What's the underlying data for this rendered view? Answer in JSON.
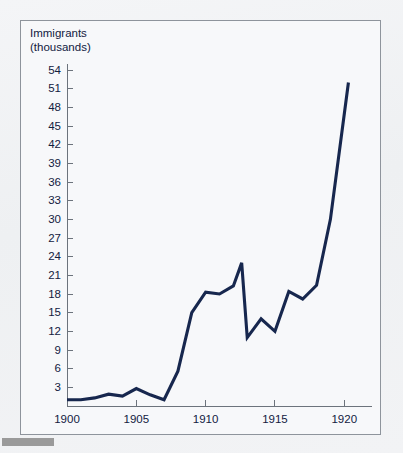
{
  "figure": {
    "title_line1": "Immigrants",
    "title_line2": "(thousands)",
    "background_color": "#f7f8fa",
    "frame_color": "#8e949c",
    "line_color": "#17274e",
    "axis_color": "#6c737c",
    "gray_bar_color": "#9a9a9a"
  },
  "chart_data": {
    "type": "line",
    "title": "Immigrants (thousands)",
    "xlabel": "",
    "ylabel": "Immigrants (thousands)",
    "xlim": [
      1900,
      1922
    ],
    "ylim": [
      0,
      54
    ],
    "grid": false,
    "legend": "none",
    "ytick_labels": [
      "54",
      "51",
      "48",
      "45",
      "42",
      "39",
      "36",
      "33",
      "30",
      "27",
      "24",
      "21",
      "18",
      "15",
      "12",
      "9",
      "6",
      "3"
    ],
    "ytick_values": [
      54,
      51,
      48,
      45,
      42,
      39,
      36,
      33,
      30,
      27,
      24,
      21,
      18,
      15,
      12,
      9,
      6,
      3
    ],
    "xtick_labels": [
      "1900",
      "1905",
      "1910",
      "1915",
      "1920"
    ],
    "xtick_values": [
      1900,
      1905,
      1910,
      1915,
      1920
    ],
    "x": [
      1900,
      1901,
      1902,
      1903,
      1904,
      1905,
      1906,
      1907,
      1908,
      1909,
      1910,
      1911,
      1912,
      1913,
      1914,
      1915,
      1916,
      1917,
      1918,
      1919,
      1920,
      1921
    ],
    "values": [
      1.0,
      1.0,
      1.2,
      1.8,
      1.6,
      1.5,
      2.8,
      1.0,
      1.0,
      5.6,
      15.0,
      18.3,
      18.0,
      19.2,
      23.0,
      11.0,
      14.0,
      13.1,
      12.0,
      18.4,
      17.2,
      19.4
    ],
    "series": [
      {
        "name": "Immigrants",
        "points": [
          {
            "x": 1900,
            "y": 1.0
          },
          {
            "x": 1901,
            "y": 1.0
          },
          {
            "x": 1902,
            "y": 1.3
          },
          {
            "x": 1903,
            "y": 1.9
          },
          {
            "x": 1904,
            "y": 1.6
          },
          {
            "x": 1905,
            "y": 2.8
          },
          {
            "x": 1906,
            "y": 1.8
          },
          {
            "x": 1907,
            "y": 1.0
          },
          {
            "x": 1908,
            "y": 5.6
          },
          {
            "x": 1909,
            "y": 15.0
          },
          {
            "x": 1910,
            "y": 18.3
          },
          {
            "x": 1911,
            "y": 18.0
          },
          {
            "x": 1912,
            "y": 19.3
          },
          {
            "x": 1912.6,
            "y": 23.0
          },
          {
            "x": 1913,
            "y": 11.0
          },
          {
            "x": 1914,
            "y": 14.0
          },
          {
            "x": 1915,
            "y": 12.0
          },
          {
            "x": 1916,
            "y": 18.4
          },
          {
            "x": 1917,
            "y": 17.2
          },
          {
            "x": 1918,
            "y": 19.4
          },
          {
            "x": 1919,
            "y": 30.0
          },
          {
            "x": 1920.3,
            "y": 52.0
          }
        ]
      }
    ]
  }
}
